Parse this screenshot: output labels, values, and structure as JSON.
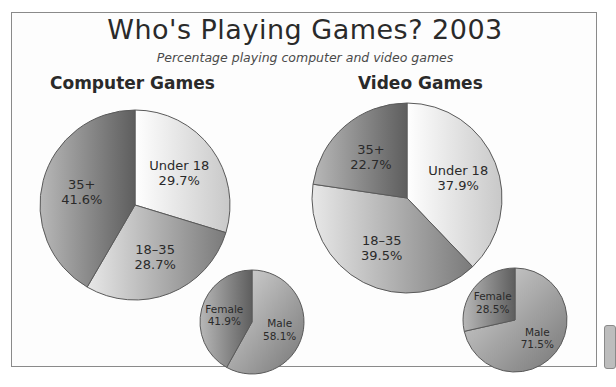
{
  "title": "Who's Playing Games? 2003",
  "subtitle": "Percentage playing computer and video games",
  "sections": {
    "computer": "Computer Games",
    "video": "Video Games"
  },
  "chart_data": [
    {
      "type": "pie",
      "title": "Computer Games — Age",
      "categories": [
        "Under 18",
        "18–35",
        "35+"
      ],
      "values": [
        29.7,
        28.7,
        41.6
      ],
      "labels": [
        "29.7%",
        "28.7%",
        "41.6%"
      ]
    },
    {
      "type": "pie",
      "title": "Computer Games — Gender",
      "categories": [
        "Male",
        "Female"
      ],
      "values": [
        58.1,
        41.9
      ],
      "labels": [
        "58.1%",
        "41.9%"
      ]
    },
    {
      "type": "pie",
      "title": "Video Games — Age",
      "categories": [
        "Under 18",
        "18–35",
        "35+"
      ],
      "values": [
        37.9,
        39.5,
        22.7
      ],
      "labels": [
        "37.9%",
        "39.5%",
        "22.7%"
      ]
    },
    {
      "type": "pie",
      "title": "Video Games — Gender",
      "categories": [
        "Male",
        "Female"
      ],
      "values": [
        71.5,
        28.5
      ],
      "labels": [
        "71.5%",
        "28.5%"
      ]
    }
  ],
  "colors": {
    "light": "#e4e4e4",
    "mid": "#9a9a9a",
    "dark": "#6e6e6e",
    "border": "#5a5a5a"
  }
}
